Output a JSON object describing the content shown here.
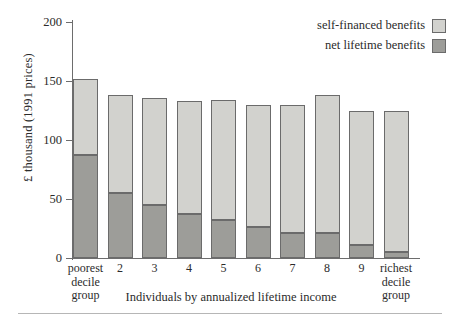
{
  "chart_data": {
    "type": "bar",
    "subtype": "stacked-vertical",
    "title": "",
    "xlabel": "Individuals by annualized lifetime income",
    "ylabel": "£ thousand (1991 prices)",
    "ylim": [
      0,
      200
    ],
    "yticks": [
      0,
      50,
      100,
      150,
      200
    ],
    "ytick_labels": [
      "0",
      "50",
      "100",
      "150",
      "200"
    ],
    "grid": false,
    "legend_position": "top-right",
    "categories": [
      "poorest decile group",
      "2",
      "3",
      "4",
      "5",
      "6",
      "7",
      "8",
      "9",
      "richest decile group"
    ],
    "category_display": [
      [
        "poorest",
        "decile",
        "group"
      ],
      [
        "2"
      ],
      [
        "3"
      ],
      [
        "4"
      ],
      [
        "5"
      ],
      [
        "6"
      ],
      [
        "7"
      ],
      [
        "8"
      ],
      [
        "9"
      ],
      [
        "richest",
        "decile",
        "group"
      ]
    ],
    "series": [
      {
        "name": "net lifetime benefits",
        "color": "#9d9d99",
        "values": [
          87,
          55,
          45,
          37,
          32,
          26,
          21,
          21,
          11,
          5
        ]
      },
      {
        "name": "self-financed benefits",
        "color": "#d2d2ce",
        "values": [
          65,
          83,
          91,
          96,
          102,
          104,
          109,
          117,
          114,
          120
        ]
      }
    ],
    "totals": [
      152,
      138,
      136,
      133,
      134,
      130,
      130,
      138,
      125,
      125
    ]
  },
  "legend": {
    "items": [
      {
        "label": "self-financed benefits",
        "swatch": "light"
      },
      {
        "label": "net lifetime benefits",
        "swatch": "dark"
      }
    ]
  },
  "axes": {
    "y_title": "£ thousand (1991 prices)",
    "y_ticks": [
      "200",
      "150",
      "100",
      "50",
      "0"
    ],
    "x_caption": "Individuals by annualized lifetime income"
  },
  "colors": {
    "light_gray": "#d2d2ce",
    "dark_gray": "#9d9d99",
    "outline": "#6b6b6b",
    "axis": "#6d6d6d",
    "text": "#2b2b2b",
    "background": "#ffffff"
  }
}
